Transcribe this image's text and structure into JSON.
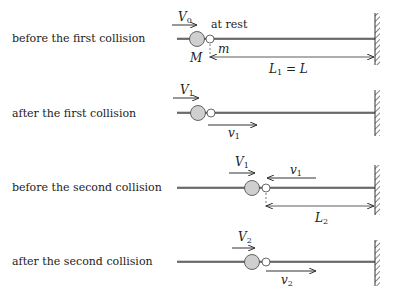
{
  "rows": [
    {
      "label": "before the first collision",
      "big_ball_velocity": {
        "symbol": "V",
        "sub": "0",
        "direction": "right"
      },
      "small_ball_note": "at rest",
      "big_ball_name": "M",
      "small_ball_name": "m",
      "distance": {
        "symbol": "L",
        "sub": "1",
        "suffix": " = L"
      }
    },
    {
      "label": "after the first collision",
      "big_ball_velocity": {
        "symbol": "V",
        "sub": "1",
        "direction": "right"
      },
      "small_ball_velocity": {
        "symbol": "v",
        "sub": "1",
        "direction": "right"
      }
    },
    {
      "label": "before the second collision",
      "big_ball_velocity": {
        "symbol": "V",
        "sub": "1",
        "direction": "right"
      },
      "small_ball_velocity": {
        "symbol": "v",
        "sub": "1",
        "direction": "left"
      },
      "distance": {
        "symbol": "L",
        "sub": "2",
        "suffix": ""
      }
    },
    {
      "label": "after the second collision",
      "big_ball_velocity": {
        "symbol": "V",
        "sub": "2",
        "direction": "right"
      },
      "small_ball_velocity": {
        "symbol": "v",
        "sub": "2",
        "direction": "right"
      }
    }
  ],
  "colors": {
    "ball_fill": "#cfcfcf",
    "line": "#444444",
    "rod": "#777777",
    "background": "#ffffff"
  }
}
